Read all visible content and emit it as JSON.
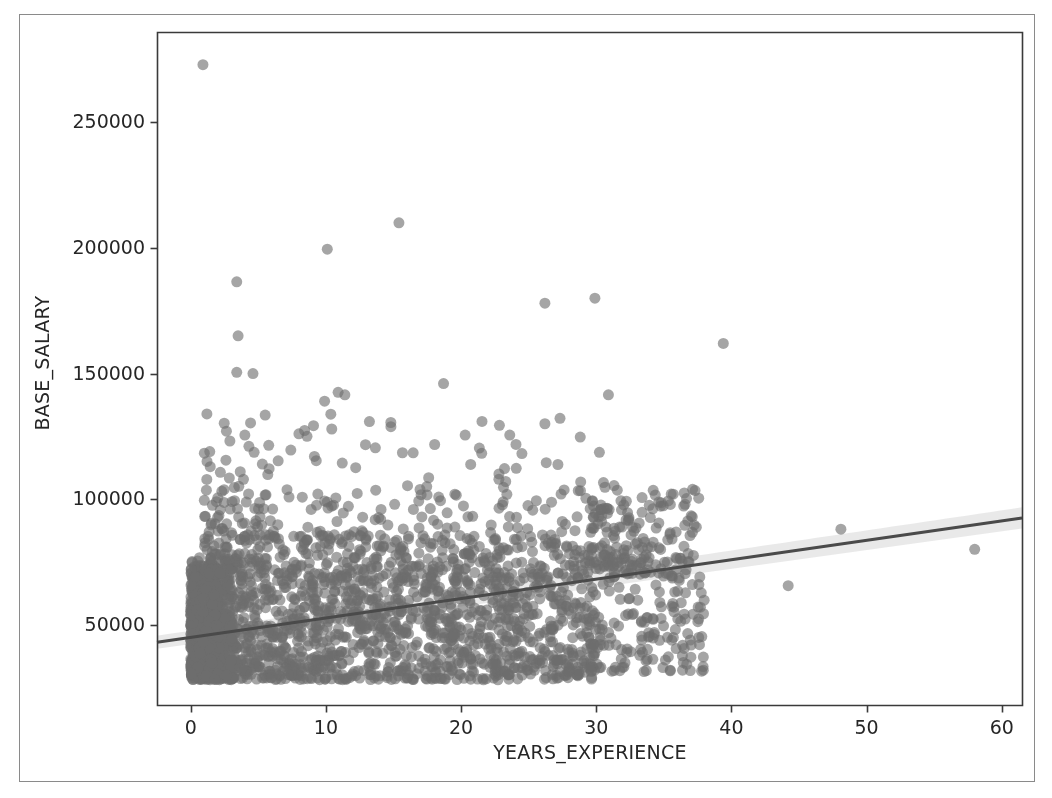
{
  "figure": {
    "background_color": "#ffffff",
    "frame_color": "#8a8a8a",
    "axes_color": "#3a3a3a"
  },
  "chart_data": {
    "type": "scatter",
    "title": "",
    "xlabel": "YEARS_EXPERIENCE",
    "ylabel": "BASE_SALARY",
    "xlim": [
      -2.5,
      61.5
    ],
    "ylim": [
      18000,
      286000
    ],
    "xticks": [
      0,
      10,
      20,
      30,
      40,
      50,
      60
    ],
    "xticklabels": [
      "0",
      "10",
      "20",
      "30",
      "40",
      "50",
      "60"
    ],
    "yticks": [
      50000,
      100000,
      150000,
      200000,
      250000
    ],
    "yticklabels": [
      "50000",
      "100000",
      "150000",
      "200000",
      "250000"
    ],
    "grid": false,
    "legend": null,
    "marker": {
      "color": "#6e6e6e",
      "edge_color": "#6e6e6e",
      "size": 11,
      "alpha": 0.62
    },
    "regression": {
      "type": "linear-fit",
      "color": "#4a4a4a",
      "line_width": 3.0,
      "ci_color": "#cfcfcf",
      "ci_alpha": 0.45,
      "x_start": -2.5,
      "x_end": 61.5,
      "y_start": 43000,
      "y_end": 92500,
      "ci_half_width_start": 2600,
      "ci_half_width_end": 4200
    },
    "density_note": "Heavy overplotting between 0 and 38 years; salary mass concentrated 28000-85000.",
    "clusters": [
      {
        "name": "core-dense-block",
        "n": 1450,
        "x_min": 0.0,
        "x_max": 30.0,
        "y_min": 28000,
        "y_max": 70000,
        "weight": 1.0
      },
      {
        "name": "entry-spike-0to3",
        "n": 520,
        "x_min": 0.0,
        "x_max": 3.2,
        "y_min": 28000,
        "y_max": 76000,
        "weight": 1.0
      },
      {
        "name": "mid-band-70k-85k",
        "n": 430,
        "x_min": 1.0,
        "x_max": 37.5,
        "y_min": 69000,
        "y_max": 86000,
        "weight": 1.0
      },
      {
        "name": "upper-band-85k-105k",
        "n": 190,
        "x_min": 1.0,
        "x_max": 38.0,
        "y_min": 85000,
        "y_max": 106000,
        "weight": 1.0
      },
      {
        "name": "senior-tail-30to38",
        "n": 230,
        "x_min": 29.5,
        "x_max": 38.0,
        "y_min": 31000,
        "y_max": 100000,
        "weight": 1.0
      },
      {
        "name": "sparse-high-110k-135k",
        "n": 48,
        "x_min": 1.0,
        "x_max": 31.0,
        "y_min": 108000,
        "y_max": 134000,
        "weight": 1.0
      }
    ],
    "outliers": [
      {
        "x": 0.9,
        "y": 273000
      },
      {
        "x": 15.4,
        "y": 210000
      },
      {
        "x": 10.1,
        "y": 199500
      },
      {
        "x": 3.4,
        "y": 186500
      },
      {
        "x": 29.9,
        "y": 180000
      },
      {
        "x": 26.2,
        "y": 178000
      },
      {
        "x": 3.5,
        "y": 165000
      },
      {
        "x": 39.4,
        "y": 162000
      },
      {
        "x": 3.4,
        "y": 150500
      },
      {
        "x": 4.6,
        "y": 150000
      },
      {
        "x": 18.7,
        "y": 146000
      },
      {
        "x": 10.9,
        "y": 142500
      },
      {
        "x": 11.4,
        "y": 141500
      },
      {
        "x": 30.9,
        "y": 141500
      },
      {
        "x": 9.9,
        "y": 139000
      },
      {
        "x": 14.8,
        "y": 130500
      },
      {
        "x": 26.2,
        "y": 130000
      },
      {
        "x": 4.0,
        "y": 125500
      },
      {
        "x": 20.3,
        "y": 125500
      },
      {
        "x": 23.6,
        "y": 125500
      },
      {
        "x": 8.0,
        "y": 126000
      },
      {
        "x": 8.6,
        "y": 125000
      },
      {
        "x": 4.3,
        "y": 121000
      },
      {
        "x": 7.4,
        "y": 119500
      },
      {
        "x": 26.3,
        "y": 114500
      },
      {
        "x": 2.6,
        "y": 115500
      },
      {
        "x": 1.2,
        "y": 115000
      },
      {
        "x": 12.2,
        "y": 112500
      },
      {
        "x": 22.8,
        "y": 110000
      },
      {
        "x": 23.3,
        "y": 107000
      },
      {
        "x": 17.6,
        "y": 108500
      },
      {
        "x": 48.1,
        "y": 88000
      },
      {
        "x": 58.0,
        "y": 80000
      },
      {
        "x": 44.2,
        "y": 65500
      },
      {
        "x": 1.0,
        "y": 99500
      },
      {
        "x": 2.0,
        "y": 100500
      }
    ]
  }
}
